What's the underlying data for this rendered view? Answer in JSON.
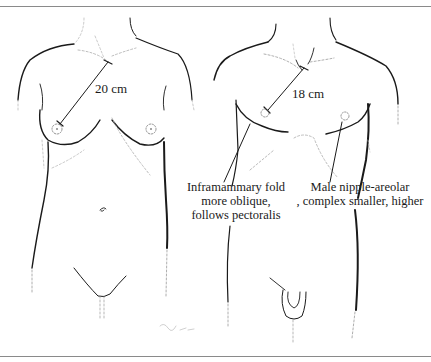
{
  "figure": {
    "panels": [
      {
        "id": "female",
        "measurement": "20 cm"
      },
      {
        "id": "male",
        "measurement": "18 cm"
      }
    ],
    "annotations": [
      {
        "id": "inframammary",
        "lines": [
          "Inframammary fold",
          "more oblique,",
          "follows pectoralis"
        ]
      },
      {
        "id": "nac",
        "lines": [
          "Male nipple-areolar",
          ", complex smaller, higher"
        ]
      }
    ],
    "signature": "Gjoa",
    "colors": {
      "line": "#1a1a1a",
      "dashed": "#9a9a9a",
      "rule": "#8a8a8a",
      "background": "#ffffff"
    }
  }
}
